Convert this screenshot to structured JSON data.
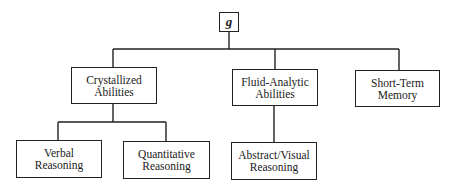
{
  "diagram": {
    "type": "hierarchy",
    "root": {
      "id": "g",
      "label": "g"
    },
    "level2": [
      {
        "id": "crystallized",
        "lines": [
          "Crystallized",
          "Abilities"
        ]
      },
      {
        "id": "fluid",
        "lines": [
          "Fluid-Analytic",
          "Abilities"
        ]
      },
      {
        "id": "stm",
        "lines": [
          "Short-Term",
          "Memory"
        ]
      }
    ],
    "level3": [
      {
        "id": "verbal",
        "parent": "crystallized",
        "lines": [
          "Verbal",
          "Reasoning"
        ]
      },
      {
        "id": "quant",
        "parent": "crystallized",
        "lines": [
          "Quantitative",
          "Reasoning"
        ]
      },
      {
        "id": "abstract",
        "parent": "fluid",
        "lines": [
          "Abstract/Visual",
          "Reasoning"
        ]
      }
    ],
    "line_color": "#222222"
  }
}
